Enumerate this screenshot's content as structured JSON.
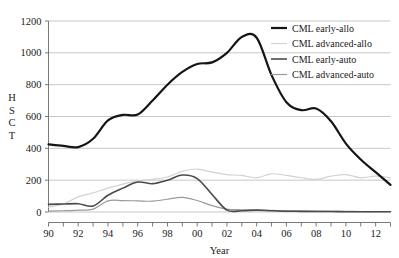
{
  "chart_data": {
    "type": "line",
    "title": "",
    "xlabel": "Year",
    "ylabel": "HSCT",
    "ylabel_letters": [
      "H",
      "S",
      "C",
      "T"
    ],
    "xlim": [
      1990,
      2013
    ],
    "ylim": [
      0,
      1200
    ],
    "grid": true,
    "grid_axis": "y",
    "legend_position": "top-right",
    "ytick_labels": [
      "0",
      "200",
      "400",
      "600",
      "800",
      "1000",
      "1200"
    ],
    "ytick_values": [
      0,
      200,
      400,
      600,
      800,
      1000,
      1200
    ],
    "xtick_labels": [
      "90",
      "92",
      "94",
      "96",
      "98",
      "00",
      "02",
      "04",
      "06",
      "08",
      "10",
      "12"
    ],
    "xtick_values": [
      1990,
      1992,
      1994,
      1996,
      1998,
      2000,
      2002,
      2004,
      2006,
      2008,
      2010,
      2012
    ],
    "x": [
      1990,
      1991,
      1992,
      1993,
      1994,
      1995,
      1996,
      1997,
      1998,
      1999,
      2000,
      2001,
      2002,
      2003,
      2004,
      2005,
      2006,
      2007,
      2008,
      2009,
      2010,
      2011,
      2012,
      2013
    ],
    "series": [
      {
        "name": "CML early-allo",
        "color": "#151515",
        "width": 2.2,
        "values": [
          425,
          415,
          408,
          460,
          575,
          610,
          612,
          700,
          800,
          880,
          930,
          940,
          1000,
          1100,
          1095,
          860,
          690,
          640,
          650,
          570,
          430,
          330,
          250,
          170
        ]
      },
      {
        "name": "CML advanced-allo",
        "color": "#d2d2d2",
        "width": 1.2,
        "values": [
          30,
          50,
          95,
          120,
          150,
          175,
          195,
          205,
          220,
          255,
          270,
          250,
          235,
          230,
          215,
          240,
          230,
          215,
          205,
          225,
          235,
          215,
          225,
          215
        ]
      },
      {
        "name": "CML early-auto",
        "color": "#4a4a4a",
        "width": 1.6,
        "values": [
          48,
          50,
          52,
          38,
          105,
          150,
          188,
          178,
          200,
          232,
          210,
          110,
          12,
          8,
          12,
          8,
          5,
          4,
          3,
          3,
          2,
          2,
          2,
          2
        ]
      },
      {
        "name": "CML advanced-auto",
        "color": "#9a9a9a",
        "width": 1.2,
        "values": [
          5,
          8,
          12,
          18,
          70,
          72,
          70,
          68,
          80,
          92,
          72,
          40,
          18,
          14,
          12,
          10,
          8,
          6,
          5,
          4,
          4,
          3,
          3,
          3
        ]
      }
    ]
  },
  "legend": {
    "items": [
      {
        "label": "CML early-allo"
      },
      {
        "label": "CML advanced-allo"
      },
      {
        "label": "CML early-auto"
      },
      {
        "label": "CML advanced-auto"
      }
    ]
  },
  "axes": {
    "x_title": "Year",
    "y_title": "HSCT"
  }
}
